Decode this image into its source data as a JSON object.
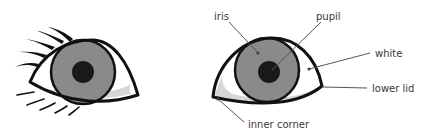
{
  "diagram": {
    "colors": {
      "outline": "#111111",
      "iris": "#8a8a8a",
      "pupil": "#1a1a1a",
      "white": "#ffffff",
      "lid_shadow": "#d6d6d6",
      "leader": "#555555",
      "label_text": "#3a3a3a"
    },
    "left_eye": {
      "description": "stylized eye with eyelashes"
    },
    "right_eye": {
      "description": "labeled eye anatomy"
    },
    "labels": {
      "iris": "iris",
      "pupil": "pupil",
      "white": "white",
      "lower_lid": "lower lid",
      "inner_corner": "inner corner"
    }
  }
}
